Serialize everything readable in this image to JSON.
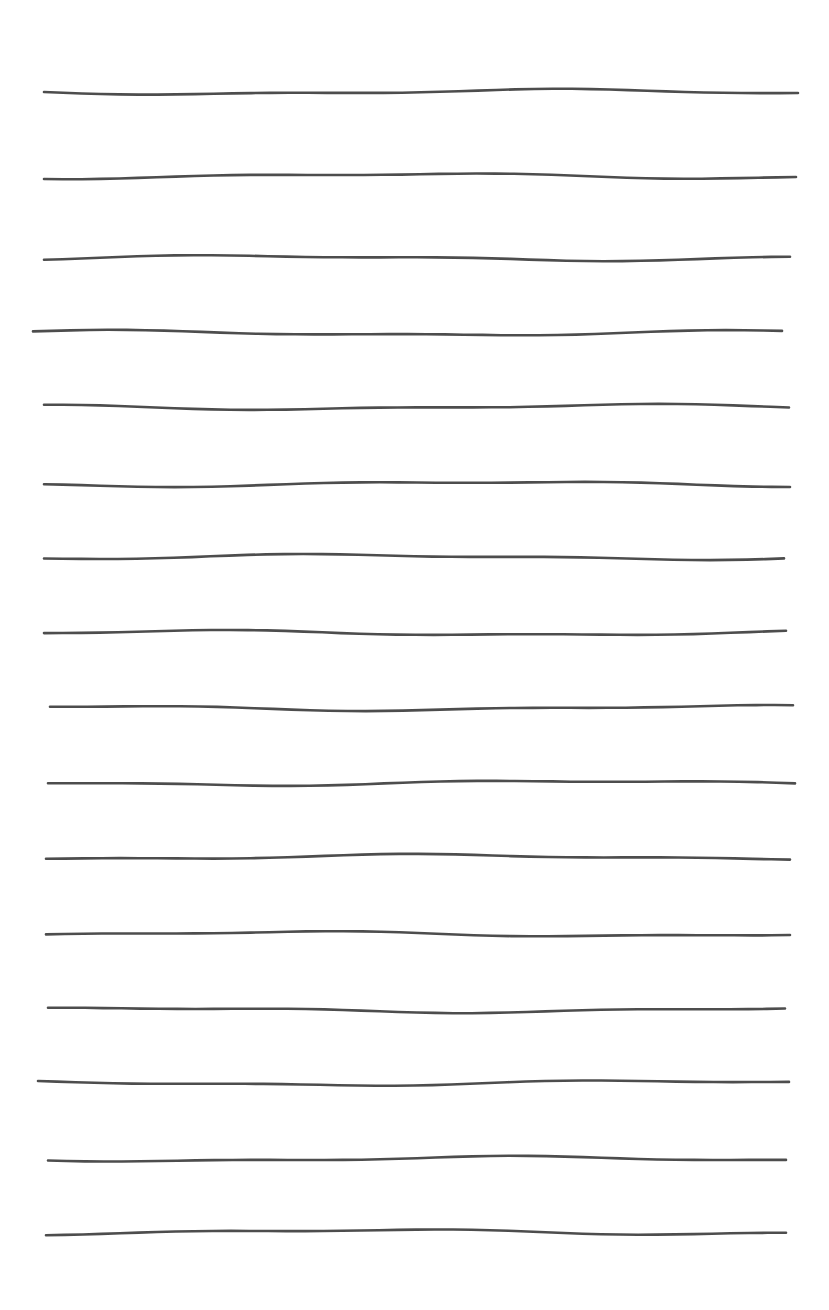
{
  "sheet": {
    "background": "#ffffff",
    "line_color": "#3a3a3a",
    "line_count": 16,
    "lines": [
      {
        "y": 92,
        "x1": 44,
        "x2": 798
      },
      {
        "y": 176,
        "x1": 44,
        "x2": 796
      },
      {
        "y": 258,
        "x1": 44,
        "x2": 790
      },
      {
        "y": 333,
        "x1": 33,
        "x2": 782
      },
      {
        "y": 407,
        "x1": 44,
        "x2": 789
      },
      {
        "y": 484,
        "x1": 44,
        "x2": 790
      },
      {
        "y": 557,
        "x1": 44,
        "x2": 784
      },
      {
        "y": 633,
        "x1": 44,
        "x2": 786
      },
      {
        "y": 708,
        "x1": 50,
        "x2": 793
      },
      {
        "y": 783,
        "x1": 48,
        "x2": 795
      },
      {
        "y": 857,
        "x1": 46,
        "x2": 790
      },
      {
        "y": 934,
        "x1": 46,
        "x2": 790
      },
      {
        "y": 1010,
        "x1": 48,
        "x2": 785
      },
      {
        "y": 1083,
        "x1": 38,
        "x2": 789
      },
      {
        "y": 1159,
        "x1": 48,
        "x2": 786
      },
      {
        "y": 1232,
        "x1": 46,
        "x2": 786
      }
    ]
  }
}
